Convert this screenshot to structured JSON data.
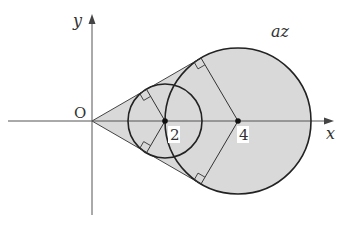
{
  "diagram": {
    "axes": {
      "x_label": "x",
      "y_label": "y",
      "origin_label": "O"
    },
    "points": [
      {
        "label": "2",
        "value": 2
      },
      {
        "label": "4",
        "value": 4
      }
    ],
    "region_label": "az",
    "circles": [
      {
        "center": 2,
        "radius": 1
      },
      {
        "center": 4,
        "radius": 2
      }
    ],
    "colors": {
      "fill": "#d9d9d9",
      "stroke": "#222222",
      "axis": "#555555"
    }
  }
}
